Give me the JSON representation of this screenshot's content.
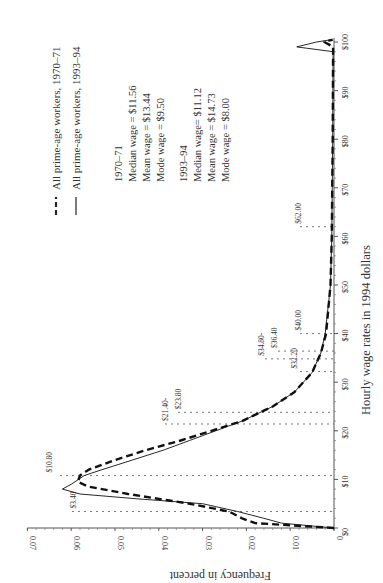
{
  "chart_data": {
    "type": "line",
    "orientation": "rotated-90-clockwise",
    "title": "",
    "xlabel": "Hourly wage rates in 1994 dollars",
    "ylabel": "Frequency in percent",
    "xlim": [
      0,
      100
    ],
    "ylim": [
      0,
      0.07
    ],
    "x_ticks": [
      "$0",
      "$10",
      "$20",
      "$30",
      "$40",
      "$50",
      "$60",
      "$70",
      "$80",
      "$90",
      "$100"
    ],
    "x_tick_values": [
      0,
      10,
      20,
      30,
      40,
      50,
      60,
      70,
      80,
      90,
      100
    ],
    "y_ticks": [
      "0",
      "0.01",
      "0.02",
      "0.03",
      "0.04",
      "0.05",
      "0.06",
      "0.07"
    ],
    "y_tick_values": [
      0,
      0.01,
      0.02,
      0.03,
      0.04,
      0.05,
      0.06,
      0.07
    ],
    "grid": false,
    "legend_position": "top-right",
    "series": [
      {
        "name": "All prime-age workers, 1970–71",
        "style": "dashed",
        "x": [
          0,
          1,
          2,
          3.4,
          5,
          7,
          8.5,
          9.5,
          10.8,
          12,
          14,
          16,
          18,
          20,
          22,
          25,
          28,
          32,
          36,
          40,
          50,
          60,
          80,
          99,
          100,
          100.5
        ],
        "values": [
          0,
          0.018,
          0.021,
          0.024,
          0.033,
          0.047,
          0.056,
          0.0585,
          0.058,
          0.056,
          0.05,
          0.043,
          0.035,
          0.028,
          0.021,
          0.014,
          0.009,
          0.005,
          0.003,
          0.0018,
          0.0008,
          0.0005,
          0.0003,
          0.0002,
          0.0022,
          0.0003
        ]
      },
      {
        "name": "All prime-age workers, 1993–94",
        "style": "solid",
        "x": [
          0,
          1,
          2,
          3.4,
          5,
          6,
          7,
          8,
          9,
          10.8,
          12,
          14,
          16,
          18,
          20,
          22,
          25,
          28,
          32,
          36,
          40,
          50,
          60,
          80,
          98,
          99,
          100,
          100.5
        ],
        "values": [
          0,
          0.012,
          0.016,
          0.022,
          0.03,
          0.045,
          0.058,
          0.062,
          0.06,
          0.057,
          0.053,
          0.046,
          0.039,
          0.033,
          0.027,
          0.021,
          0.014,
          0.009,
          0.005,
          0.003,
          0.002,
          0.0008,
          0.0005,
          0.0003,
          0.0002,
          0.0085,
          0.004,
          0.0005
        ]
      }
    ],
    "reference_lines": [
      {
        "label": "$3.40",
        "value": 3.4
      },
      {
        "label": "$10.80",
        "value": 10.8
      },
      {
        "label": "$21.40-",
        "value": 21.4
      },
      {
        "label": "$23.80",
        "value": 23.8
      },
      {
        "label": "$32.20",
        "value": 32.2
      },
      {
        "label": "$34.80-",
        "value": 34.8
      },
      {
        "label": "$36.40",
        "value": 36.4
      },
      {
        "label": "$40.00",
        "value": 40.0
      },
      {
        "label": "$62.00",
        "value": 62.0
      }
    ],
    "annotations": {
      "period_1970": {
        "heading": "1970–71",
        "lines": [
          "Median wage = $11.56",
          "Mean wage = $13.44",
          "Mode wage = $9.50"
        ]
      },
      "period_1993": {
        "heading": "1993–94",
        "lines": [
          "Median wage= $11.12",
          "Mean wage = $14.73",
          "Mode wage = $8.00"
        ]
      }
    }
  },
  "legend": {
    "item1": "All prime-age workers, 1970–71",
    "item2": "All prime-age workers, 1993–94"
  },
  "stats": {
    "h1970": "1970–71",
    "median1970": "Median wage = $11.56",
    "mean1970": "Mean wage = $13.44",
    "mode1970": "Mode wage = $9.50",
    "h1993": "1993–94",
    "median1993": "Median wage= $11.12",
    "mean1993": "Mean wage = $14.73",
    "mode1993": "Mode wage = $8.00"
  },
  "axes": {
    "xlabel": "Hourly wage rates in 1994 dollars",
    "ylabel": "Frequency in percent"
  }
}
